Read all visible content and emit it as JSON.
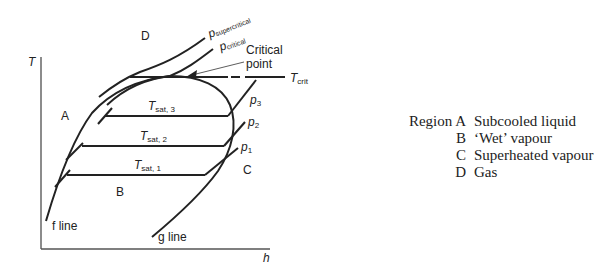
{
  "diagram": {
    "axes": {
      "y_label": "T",
      "x_label": "h"
    },
    "regions": {
      "a": "A",
      "b": "B",
      "c": "C",
      "d": "D"
    },
    "isobars": {
      "supercritical": {
        "p": "p",
        "sub": "supercritical"
      },
      "critical": {
        "p": "p",
        "sub": "critical"
      },
      "p3": {
        "p": "p",
        "sub": "3"
      },
      "p2": {
        "p": "p",
        "sub": "2"
      },
      "p1": {
        "p": "p",
        "sub": "1"
      }
    },
    "saturation_temps": {
      "t3": {
        "t": "T",
        "sub": "sat, 3"
      },
      "t2": {
        "t": "T",
        "sub": "sat, 2"
      },
      "t1": {
        "t": "T",
        "sub": "sat, 1"
      }
    },
    "critical_temp": {
      "t": "T",
      "sub": "crit"
    },
    "critical_point_label": [
      "Critical",
      "point"
    ],
    "f_line_label": "f line",
    "g_line_label": "g line"
  },
  "legend": {
    "rows": [
      {
        "key": "Region A",
        "desc": "Subcooled liquid"
      },
      {
        "key": "B",
        "desc": "‘Wet’ vapour"
      },
      {
        "key": "C",
        "desc": "Superheated vapour"
      },
      {
        "key": "D",
        "desc": "Gas"
      }
    ]
  }
}
